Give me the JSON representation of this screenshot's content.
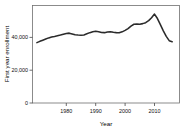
{
  "chart_data": {
    "type": "line",
    "title": "",
    "subtitle": "",
    "xlabel": "Year",
    "ylabel": "First year enrollment",
    "xlim": [
      1969,
      2017
    ],
    "ylim": [
      0,
      59400
    ],
    "grid": false,
    "legend": "none",
    "line_color": "#2b2b2b",
    "frame_color": "#6f6f6f",
    "x_ticks": [
      1980,
      1990,
      2000,
      2010
    ],
    "x_tick_labels": [
      "1980",
      "1990",
      "2000",
      "2010"
    ],
    "y_ticks": [
      0,
      20000,
      40000
    ],
    "y_tick_labels": [
      "0",
      "20,000",
      "40,000"
    ],
    "series": [
      {
        "name": "First year enrollment",
        "x": [
          1970,
          1971,
          1972,
          1973,
          1974,
          1975,
          1976,
          1977,
          1978,
          1979,
          1980,
          1981,
          1982,
          1983,
          1984,
          1985,
          1986,
          1987,
          1988,
          1989,
          1990,
          1991,
          1992,
          1993,
          1994,
          1995,
          1996,
          1997,
          1998,
          1999,
          2000,
          2001,
          2002,
          2003,
          2004,
          2005,
          2006,
          2007,
          2008,
          2009,
          2010,
          2011,
          2012,
          2013,
          2014,
          2015,
          2016
        ],
        "values": [
          36800,
          37600,
          38300,
          39000,
          39700,
          40300,
          40600,
          41000,
          41400,
          41900,
          42400,
          42600,
          42100,
          41600,
          41400,
          41300,
          41500,
          42200,
          42900,
          43500,
          43800,
          43500,
          43000,
          42900,
          43300,
          43500,
          43100,
          42900,
          42800,
          43400,
          44300,
          45400,
          46900,
          48000,
          48100,
          48000,
          48400,
          49000,
          50200,
          52000,
          54200,
          51500,
          47800,
          44000,
          40600,
          38000,
          37400
        ]
      }
    ]
  }
}
